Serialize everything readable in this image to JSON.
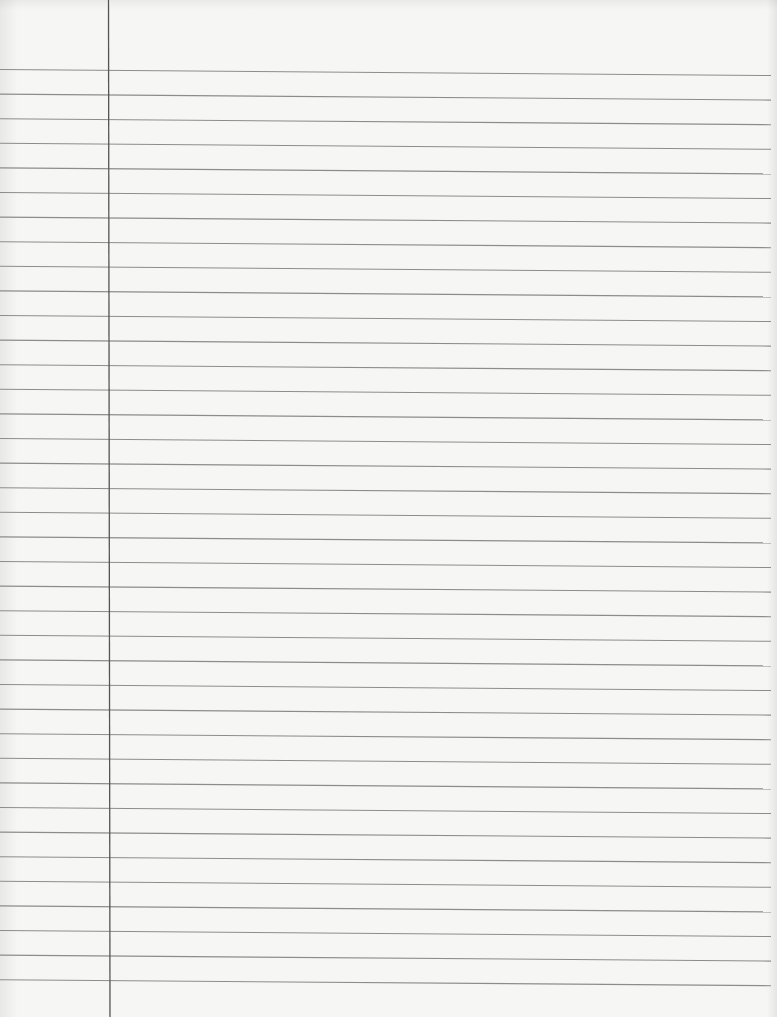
{
  "page": {
    "type": "blank lined notebook paper",
    "background_color": "#f6f6f5",
    "rule_color": "#8c8c8c",
    "margin_color": "#555555",
    "rule_count": 38,
    "rule_spacing_px": 24.6,
    "first_rule_y_left": 69.5,
    "rule_slope_drop_px": 6,
    "rule_end_x": 771,
    "margin_line_x_top": 108.5,
    "margin_line_x_bottom": 110
  }
}
